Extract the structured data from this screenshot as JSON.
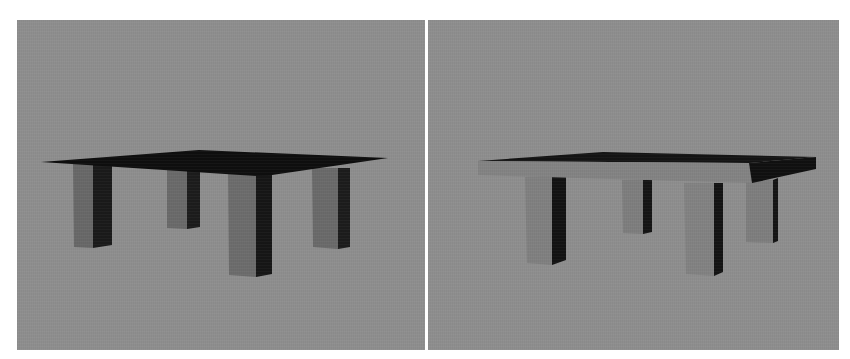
{
  "figure": {
    "panels": [
      {
        "id": "left",
        "description": "Rendered 3D table with thin (zero-thickness) dark tabletop and four rectangular legs",
        "background_color": "#8e8e8e",
        "tabletop_color": "#101010",
        "leg_front_color": "#6e6e6e",
        "leg_side_color": "#1a1a1a"
      },
      {
        "id": "right",
        "description": "Rendered 3D table with thick tabletop slab (visible lighter front edge) and four rectangular legs",
        "background_color": "#8e8e8e",
        "tabletop_color": "#151515",
        "tabletop_edge_color": "#858585",
        "leg_front_color": "#828282",
        "leg_side_color": "#141414"
      }
    ]
  }
}
